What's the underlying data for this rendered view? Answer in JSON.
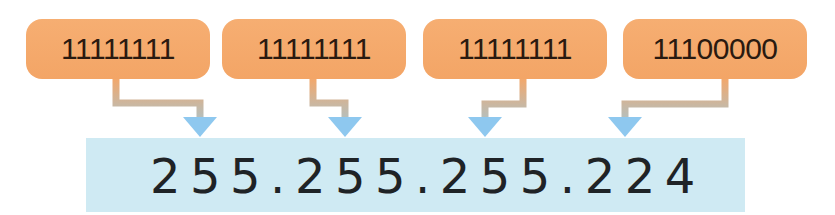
{
  "diagram": {
    "type": "binary-to-dotted-decimal",
    "octets": [
      {
        "binary": "11111111",
        "decimal": "255"
      },
      {
        "binary": "11111111",
        "decimal": "255"
      },
      {
        "binary": "11111111",
        "decimal": "255"
      },
      {
        "binary": "11100000",
        "decimal": "224"
      }
    ],
    "result": "255.255.255.224",
    "colors": {
      "octet_box": "#f4a86a",
      "result_box": "#cfeaf3",
      "arrow": "#8ec8ef",
      "connector_top": "#f2a86c",
      "connector_bottom": "#b7c0bf",
      "text": "#1f2326"
    }
  }
}
